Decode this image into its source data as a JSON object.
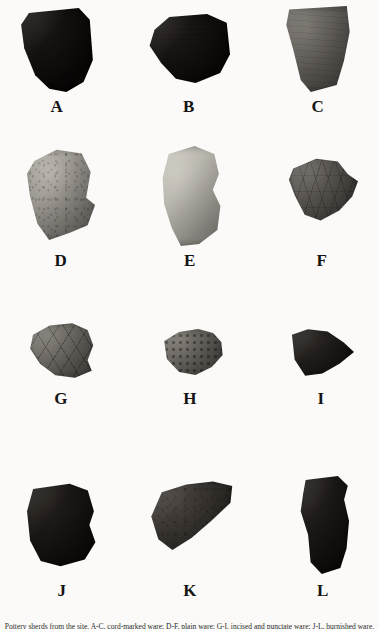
{
  "figure": {
    "background_color": "#fbfaf8",
    "label_color": "#141414",
    "caption": "Pottery sherds from the site. A-C, cord-marked ware; D-F, plain ware; G-I, incised and punctate ware; J-L, burnished ware."
  },
  "specimens": [
    {
      "label": "A",
      "description": "Dark cord-marked rim sherd with cross-hatched surface",
      "tone": "very-dark",
      "base_color": "#1c1917",
      "shade_color": "#0a0908",
      "texture": "cross-hatch",
      "shape": "polygon(14% 6%, 78% 0%, 92% 14%, 96% 62%, 84% 88%, 62% 100%, 40% 96%, 22% 80%, 8% 48%, 4% 20%)",
      "x": 18,
      "y": 8,
      "w": 78,
      "h": 84,
      "label_x": 0,
      "label_y": 98
    },
    {
      "label": "B",
      "description": "Dark fabric-impressed sherd, wide and low",
      "tone": "very-dark",
      "base_color": "#201c1a",
      "shade_color": "#0c0a09",
      "texture": "fabric",
      "shape": "polygon(8% 22%, 26% 4%, 72% 0%, 96% 12%, 100% 56%, 88% 82%, 58% 96%, 34% 90%, 16% 68%, 2% 44%)",
      "x": 148,
      "y": 14,
      "w": 82,
      "h": 72,
      "label_x": 0,
      "label_y": 98
    },
    {
      "label": "C",
      "description": "Medium gray trapezoidal cord-marked body sherd",
      "tone": "medium",
      "base_color": "#77736e",
      "shade_color": "#4a4743",
      "texture": "cord",
      "shape": "polygon(10% 4%, 90% 0%, 94% 30%, 86% 64%, 76% 92%, 40% 100%, 26% 86%, 16% 52%, 6% 22%)",
      "x": 282,
      "y": 6,
      "w": 72,
      "h": 86,
      "label_x": 0,
      "label_y": 98
    },
    {
      "label": "D",
      "description": "Light gray sherd with dark diagonal shaded facet",
      "tone": "light",
      "base_color": "#b4b0a9",
      "shade_color": "#6d6a65",
      "texture": "speckled",
      "shape": "polygon(14% 14%, 44% 2%, 78% 6%, 90% 26%, 84% 54%, 96% 62%, 86% 84%, 62% 92%, 34% 100%, 18% 82%, 8% 52%, 4% 28%)",
      "x": 24,
      "y": 148,
      "w": 74,
      "h": 92,
      "label_x": 0,
      "label_y": 252
    },
    {
      "label": "E",
      "description": "Very pale plain body sherd",
      "tone": "very-light",
      "base_color": "#c8c5bd",
      "shade_color": "#a3a098",
      "texture": "smooth",
      "shape": "polygon(22% 8%, 56% 0%, 82% 8%, 88% 28%, 80% 44%, 90% 60%, 86% 84%, 62% 98%, 38% 100%, 26% 82%, 16% 58%, 14% 32%)",
      "x": 152,
      "y": 146,
      "w": 76,
      "h": 100,
      "label_x": 0,
      "label_y": 252
    },
    {
      "label": "F",
      "description": "Medium-dark sherd with incised cross-hatch decoration",
      "tone": "medium-dark",
      "base_color": "#6b6762",
      "shade_color": "#3c3936",
      "texture": "incised",
      "shape": "polygon(10% 18%, 42% 4%, 72% 8%, 86% 26%, 100% 36%, 92% 58%, 74% 78%, 48% 92%, 26% 84%, 12% 56%, 4% 34%)",
      "x": 286,
      "y": 156,
      "w": 72,
      "h": 70,
      "label_x": 0,
      "label_y": 252
    },
    {
      "label": "G",
      "description": "Small gray sherd with incised zigzag/chevron lines",
      "tone": "medium",
      "base_color": "#817d77",
      "shade_color": "#504d49",
      "texture": "zigzag",
      "shape": "polygon(10% 22%, 34% 6%, 66% 2%, 88% 14%, 96% 40%, 88% 66%, 94% 84%, 70% 96%, 42% 92%, 20% 72%, 6% 46%)",
      "x": 26,
      "y": 322,
      "w": 70,
      "h": 58,
      "label_x": 0,
      "label_y": 390
    },
    {
      "label": "H",
      "description": "Small sherd with punctate dot row along lower edge",
      "tone": "medium",
      "base_color": "#7e7a74",
      "shade_color": "#4c4945",
      "texture": "punctate",
      "shape": "polygon(12% 26%, 34% 8%, 62% 2%, 84% 10%, 96% 28%, 98% 54%, 82% 78%, 58% 94%, 34% 88%, 16% 62%)",
      "x": 156,
      "y": 328,
      "w": 68,
      "h": 50,
      "label_x": 0,
      "label_y": 390
    },
    {
      "label": "I",
      "description": "Dark wedge-shaped sherd tapering to a point at right",
      "tone": "dark",
      "base_color": "#2e2a27",
      "shade_color": "#141211",
      "texture": "smooth",
      "shape": "polygon(6% 16%, 30% 6%, 60% 10%, 84% 30%, 100% 48%, 78% 70%, 52% 88%, 26% 92%, 10% 62%)",
      "x": 288,
      "y": 326,
      "w": 66,
      "h": 54,
      "label_x": 0,
      "label_y": 390
    },
    {
      "label": "J",
      "description": "Dark squarish burnished body sherd",
      "tone": "very-dark",
      "base_color": "#25211e",
      "shade_color": "#0e0c0b",
      "texture": "smooth",
      "shape": "polygon(12% 8%, 60% 2%, 84% 10%, 92% 34%, 86% 50%, 94% 70%, 80% 90%, 48% 98%, 22% 92%, 8% 68%, 4% 34%)",
      "x": 24,
      "y": 482,
      "w": 76,
      "h": 86,
      "label_x": 0,
      "label_y": 582
    },
    {
      "label": "K",
      "description": "Wide wedge-shaped dark gray sherd, thick at right",
      "tone": "dark",
      "base_color": "#4a4541",
      "shade_color": "#25221f",
      "texture": "speckled",
      "shape": "polygon(18% 16%, 46% 6%, 76% 2%, 98% 8%, 96% 30%, 74% 54%, 52% 76%, 30% 92%, 14% 78%, 6% 48%)",
      "x": 146,
      "y": 480,
      "w": 88,
      "h": 76,
      "label_x": 0,
      "label_y": 582
    },
    {
      "label": "L",
      "description": "Tall dark rectangular sherd",
      "tone": "very-dark",
      "base_color": "#262220",
      "shade_color": "#100e0d",
      "texture": "smooth",
      "shape": "polygon(22% 4%, 74% 0%, 90% 10%, 84% 24%, 92% 46%, 88% 74%, 78% 94%, 48% 100%, 30% 88%, 26% 60%, 14% 36%, 18% 18%)",
      "x": 292,
      "y": 476,
      "w": 62,
      "h": 98,
      "label_x": 0,
      "label_y": 582
    }
  ]
}
